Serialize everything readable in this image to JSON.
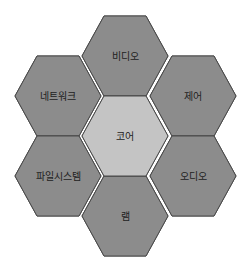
{
  "diagram": {
    "type": "hexagon-cluster",
    "colors": {
      "outer": "#8c8c8c",
      "core": "#c4c4c4",
      "outline": "#4a4a4a",
      "gap": "#ffffff"
    },
    "core": {
      "label": "코어"
    },
    "cells": [
      {
        "position": "top",
        "label": "비디오"
      },
      {
        "position": "upper-left",
        "label": "네트워크"
      },
      {
        "position": "upper-right",
        "label": "제어"
      },
      {
        "position": "lower-left",
        "label": "파일시스템"
      },
      {
        "position": "lower-right",
        "label": "오디오"
      },
      {
        "position": "bottom",
        "label": "램"
      }
    ]
  }
}
